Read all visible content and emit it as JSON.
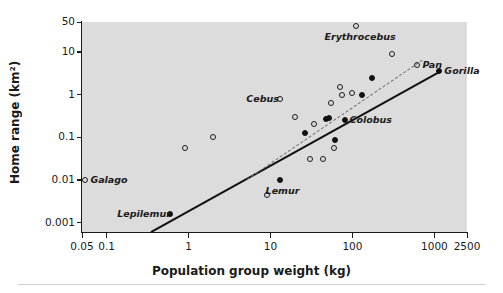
{
  "chart_data": {
    "type": "scatter",
    "title": "",
    "xlabel": "Population group weight (kg)",
    "ylabel": "Home range (km²)",
    "xscale": "log",
    "yscale": "log",
    "xlim": [
      0.05,
      2500
    ],
    "ylim": [
      0.0006,
      50
    ],
    "grid": false,
    "legend": "none",
    "xticks": [
      "0.05",
      "0.1",
      "1",
      "10",
      "100",
      "1000",
      "2500"
    ],
    "xtick_values": [
      0.05,
      0.1,
      1,
      10,
      100,
      1000,
      2500
    ],
    "yticks": [
      "50",
      "10",
      "1",
      "0.1",
      "0.01",
      "0.001"
    ],
    "ytick_values": [
      50,
      10,
      1,
      0.1,
      0.01,
      0.001
    ],
    "plot_background": "#dcdcdc",
    "series": [
      {
        "name": "open-circles",
        "marker": "open circle",
        "color": "#1a1a1a",
        "points": [
          {
            "x": 0.055,
            "y": 0.0098,
            "label": "Galago",
            "label_pos": "right"
          },
          {
            "x": 0.9,
            "y": 0.056,
            "label": ""
          },
          {
            "x": 2.0,
            "y": 0.1,
            "label": ""
          },
          {
            "x": 9.0,
            "y": 0.0045,
            "label": ""
          },
          {
            "x": 13.0,
            "y": 0.8,
            "label": "Cebus",
            "label_pos": "left"
          },
          {
            "x": 20.0,
            "y": 0.29,
            "label": ""
          },
          {
            "x": 34.0,
            "y": 0.2,
            "label": ""
          },
          {
            "x": 30.0,
            "y": 0.03,
            "label": ""
          },
          {
            "x": 44.0,
            "y": 0.03,
            "label": ""
          },
          {
            "x": 60.0,
            "y": 0.055,
            "label": ""
          },
          {
            "x": 55.0,
            "y": 0.62,
            "label": ""
          },
          {
            "x": 70.0,
            "y": 1.5,
            "label": ""
          },
          {
            "x": 75.0,
            "y": 1.0,
            "label": ""
          },
          {
            "x": 100.0,
            "y": 1.1,
            "label": ""
          },
          {
            "x": 110.0,
            "y": 40.0,
            "label": "Erythrocebus",
            "label_pos": "below"
          },
          {
            "x": 300.0,
            "y": 9.0,
            "label": ""
          },
          {
            "x": 620.0,
            "y": 5.0,
            "label": "Pan",
            "label_pos": "right"
          }
        ]
      },
      {
        "name": "filled-circles",
        "marker": "filled circle",
        "color": "#111111",
        "points": [
          {
            "x": 0.6,
            "y": 0.0016,
            "label": "Lepilemur",
            "label_pos": "left"
          },
          {
            "x": 13.0,
            "y": 0.0097,
            "label": "Lemur",
            "label_pos": "below"
          },
          {
            "x": 26.0,
            "y": 0.125,
            "label": ""
          },
          {
            "x": 48.0,
            "y": 0.26,
            "label": ""
          },
          {
            "x": 52.0,
            "y": 0.28,
            "label": ""
          },
          {
            "x": 80.0,
            "y": 0.25,
            "label": "Colobus",
            "label_pos": "right"
          },
          {
            "x": 62.0,
            "y": 0.085,
            "label": ""
          },
          {
            "x": 130.0,
            "y": 1.0,
            "label": ""
          },
          {
            "x": 175.0,
            "y": 2.4,
            "label": ""
          },
          {
            "x": 1150.0,
            "y": 3.6,
            "label": "Gorilla",
            "label_pos": "right"
          }
        ]
      }
    ],
    "trendlines": [
      {
        "name": "lower-solid-regression",
        "style": "solid",
        "color": "#111111",
        "x_start": 0.35,
        "y_start": 0.00065,
        "x_end": 1150.0,
        "y_end": 3.6
      },
      {
        "name": "upper-dashed-regression",
        "style": "dashed",
        "color": "#6e6e6e",
        "x_start": 5.2,
        "y_start": 0.0105,
        "x_end": 720.0,
        "y_end": 6.6
      }
    ],
    "annotations": [
      {
        "text": "Galago",
        "for": "open-circle"
      },
      {
        "text": "Cebus",
        "for": "open-circle"
      },
      {
        "text": "Erythrocebus",
        "for": "open-circle"
      },
      {
        "text": "Pan",
        "for": "open-circle"
      },
      {
        "text": "Lepilemur",
        "for": "filled-circle"
      },
      {
        "text": "Lemur",
        "for": "filled-circle"
      },
      {
        "text": "Colobus",
        "for": "filled-circle"
      },
      {
        "text": "Gorilla",
        "for": "filled-circle"
      }
    ]
  }
}
